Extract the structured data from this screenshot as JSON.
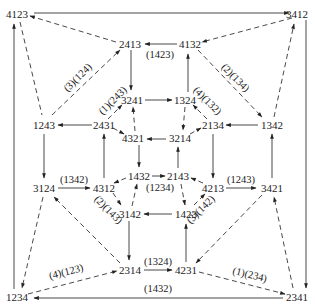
{
  "diagram": {
    "type": "permutation-graph",
    "nodes": {
      "n4123": {
        "label": "4123",
        "x": 17,
        "y": 14
      },
      "n3412": {
        "label": "3412",
        "x": 297,
        "y": 14
      },
      "n2413": {
        "label": "2413",
        "x": 130,
        "y": 44
      },
      "n4132": {
        "label": "4132",
        "x": 190,
        "y": 44
      },
      "n3241": {
        "label": "3241",
        "x": 132,
        "y": 100
      },
      "n1324": {
        "label": "1324",
        "x": 185,
        "y": 100
      },
      "n1243": {
        "label": "1243",
        "x": 44,
        "y": 125
      },
      "n2431": {
        "label": "2431",
        "x": 104,
        "y": 125
      },
      "n2134": {
        "label": "2134",
        "x": 212,
        "y": 125
      },
      "n1342": {
        "label": "1342",
        "x": 270,
        "y": 125
      },
      "n4321": {
        "label": "4321",
        "x": 133,
        "y": 138
      },
      "n3214": {
        "label": "3214",
        "x": 180,
        "y": 138
      },
      "n3124": {
        "label": "3124",
        "x": 44,
        "y": 188
      },
      "n4312": {
        "label": "4312",
        "x": 104,
        "y": 188
      },
      "n1432": {
        "label": "1432",
        "x": 138,
        "y": 176
      },
      "n2143": {
        "label": "2143",
        "x": 180,
        "y": 176
      },
      "n4213": {
        "label": "4213",
        "x": 212,
        "y": 188
      },
      "n3421": {
        "label": "3421",
        "x": 270,
        "y": 188
      },
      "n3142": {
        "label": "3142",
        "x": 130,
        "y": 214
      },
      "n1423": {
        "label": "1423",
        "x": 186,
        "y": 214
      },
      "n2314": {
        "label": "2314",
        "x": 130,
        "y": 270
      },
      "n4231": {
        "label": "4231",
        "x": 186,
        "y": 270
      },
      "n1234": {
        "label": "1234",
        "x": 17,
        "y": 297
      },
      "n2341": {
        "label": "2341",
        "x": 297,
        "y": 297
      }
    },
    "edge_labels": {
      "e1423": "(1423)",
      "e2_134": "(2)(134)",
      "e3_124": "(3)(124)",
      "e1_243": "(1)(243)",
      "e4_132": "(4)(132)",
      "e1342": "(1342)",
      "e1234": "(1234)",
      "e1243": "(1243)",
      "e2_143": "(2)(143)",
      "e3_142": "(3)(142)",
      "e4_123": "(4)(123)",
      "e1324": "(1324)",
      "e1_234": "(1)(234)",
      "e1432": "(1432)"
    },
    "edges": [
      {
        "from": "4123",
        "to": "3412",
        "style": "solid"
      },
      {
        "from": "4132",
        "to": "2413",
        "style": "solid",
        "label": "(1423)"
      },
      {
        "from": "2413",
        "to": "4123",
        "style": "dashed"
      },
      {
        "from": "1243",
        "to": "2413",
        "style": "dashed",
        "label": "(3)(124)"
      },
      {
        "from": "4123",
        "to": "1243",
        "style": "dashed"
      },
      {
        "from": "3412",
        "to": "4132",
        "style": "dashed"
      },
      {
        "from": "4132",
        "to": "1342",
        "style": "dashed",
        "label": "(2)(134)"
      },
      {
        "from": "1342",
        "to": "3412",
        "style": "dashed"
      },
      {
        "from": "2413",
        "to": "3241",
        "style": "solid"
      },
      {
        "from": "1324",
        "to": "4132",
        "style": "solid"
      },
      {
        "from": "3241",
        "to": "1324",
        "style": "solid"
      },
      {
        "from": "2431",
        "to": "3241",
        "style": "dashed",
        "label": "(1)(243)"
      },
      {
        "from": "2134",
        "to": "1324",
        "style": "dashed",
        "label": "(4)(132)"
      },
      {
        "from": "2431",
        "to": "1243",
        "style": "solid"
      },
      {
        "from": "1342",
        "to": "2134",
        "style": "solid"
      },
      {
        "from": "2431",
        "to": "4321",
        "style": "dashed"
      },
      {
        "from": "4321",
        "to": "3241",
        "style": "dashed"
      },
      {
        "from": "1324",
        "to": "3214",
        "style": "dashed"
      },
      {
        "from": "3214",
        "to": "2134",
        "style": "dashed"
      },
      {
        "from": "3214",
        "to": "4321",
        "style": "solid"
      },
      {
        "from": "4321",
        "to": "1432",
        "style": "solid"
      },
      {
        "from": "2143",
        "to": "3214",
        "style": "solid"
      },
      {
        "from": "1432",
        "to": "2143",
        "style": "solid",
        "label": "(1234)"
      },
      {
        "from": "1243",
        "to": "3124",
        "style": "solid"
      },
      {
        "from": "4312",
        "to": "2431",
        "style": "solid"
      },
      {
        "from": "2134",
        "to": "4213",
        "style": "solid"
      },
      {
        "from": "3421",
        "to": "1342",
        "style": "solid"
      },
      {
        "from": "3124",
        "to": "4312",
        "style": "solid",
        "label": "(1342)"
      },
      {
        "from": "4213",
        "to": "3421",
        "style": "solid",
        "label": "(1243)"
      },
      {
        "from": "1432",
        "to": "4312",
        "style": "dashed"
      },
      {
        "from": "4312",
        "to": "3142",
        "style": "dashed",
        "label": "(2)(143)"
      },
      {
        "from": "3142",
        "to": "1432",
        "style": "dashed"
      },
      {
        "from": "4213",
        "to": "2143",
        "style": "dashed"
      },
      {
        "from": "2143",
        "to": "1423",
        "style": "dashed"
      },
      {
        "from": "1423",
        "to": "4213",
        "style": "dashed",
        "label": "(3)(142)"
      },
      {
        "from": "1423",
        "to": "3142",
        "style": "solid"
      },
      {
        "from": "3142",
        "to": "2314",
        "style": "solid"
      },
      {
        "from": "4231",
        "to": "1423",
        "style": "solid"
      },
      {
        "from": "2314",
        "to": "4231",
        "style": "solid",
        "label": "(1324)"
      },
      {
        "from": "2314",
        "to": "3124",
        "style": "dashed"
      },
      {
        "from": "3124",
        "to": "1234",
        "style": "dashed"
      },
      {
        "from": "1234",
        "to": "2314",
        "style": "dashed",
        "label": "(4)(123)"
      },
      {
        "from": "3421",
        "to": "4231",
        "style": "dashed"
      },
      {
        "from": "4231",
        "to": "2341",
        "style": "dashed",
        "label": "(1)(234)"
      },
      {
        "from": "2341",
        "to": "3421",
        "style": "dashed"
      },
      {
        "from": "1234",
        "to": "4123",
        "style": "solid"
      },
      {
        "from": "3412",
        "to": "2341",
        "style": "solid"
      },
      {
        "from": "2341",
        "to": "1234",
        "style": "solid",
        "label": "(1432)"
      }
    ]
  }
}
